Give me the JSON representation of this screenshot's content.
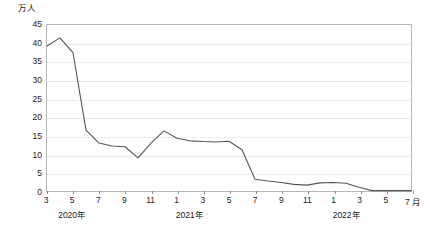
{
  "chart_data": {
    "type": "line",
    "title": "",
    "subtitle": "",
    "xlabel": "",
    "ylabel": "万人",
    "unit_suffix": "月",
    "ylim": [
      0,
      45
    ],
    "ytick_values": [
      0,
      5,
      10,
      15,
      20,
      25,
      30,
      35,
      40,
      45
    ],
    "ytick_labels": [
      "0",
      "5",
      "10",
      "15",
      "20",
      "25",
      "30",
      "35",
      "40",
      "45"
    ],
    "grid": true,
    "grid_axis": "y",
    "legend": false,
    "legend_position": "none",
    "line_color": "#555555",
    "grid_color": "#e8e8e8",
    "axis_color": "#b8b8b8",
    "text_color": "#1a1a1a",
    "x": [
      "2020-03",
      "2020-04",
      "2020-05",
      "2020-06",
      "2020-07",
      "2020-08",
      "2020-09",
      "2020-10",
      "2020-11",
      "2020-12",
      "2021-01",
      "2021-02",
      "2021-03",
      "2021-04",
      "2021-05",
      "2021-06",
      "2021-07",
      "2021-08",
      "2021-09",
      "2021-10",
      "2021-11",
      "2021-12",
      "2022-01",
      "2022-02",
      "2022-03",
      "2022-04",
      "2022-05",
      "2022-06",
      "2022-07"
    ],
    "xtick_labels": [
      "3",
      "5",
      "7",
      "9",
      "11",
      "1",
      "3",
      "5",
      "7",
      "9",
      "11",
      "1",
      "3",
      "5",
      "7"
    ],
    "xtick_positions": [
      "2020-03",
      "2020-05",
      "2020-07",
      "2020-09",
      "2020-11",
      "2021-01",
      "2021-03",
      "2021-05",
      "2021-07",
      "2021-09",
      "2021-11",
      "2022-01",
      "2022-03",
      "2022-05",
      "2022-07"
    ],
    "year_labels": [
      {
        "label": "2020年",
        "at": "2020-05"
      },
      {
        "label": "2021年",
        "at": "2021-02"
      },
      {
        "label": "2022年",
        "at": "2022-02"
      }
    ],
    "values": [
      39.3,
      41.5,
      37.5,
      16.5,
      13.0,
      12.2,
      12.0,
      9.0,
      13.0,
      16.3,
      14.3,
      13.6,
      13.4,
      13.3,
      13.5,
      11.2,
      3.2,
      2.7,
      2.3,
      1.8,
      1.6,
      2.2,
      2.3,
      2.1,
      1.0,
      0.1,
      0.1,
      0.1,
      0.1
    ]
  }
}
